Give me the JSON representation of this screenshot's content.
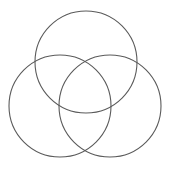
{
  "diagram": {
    "type": "venn",
    "background": "#ffffff",
    "stroke_color": "#5a5a5a",
    "circles": [
      {
        "name": "top",
        "cx": 86,
        "cy": 62,
        "r": 51
      },
      {
        "name": "left",
        "cx": 60,
        "cy": 106,
        "r": 51
      },
      {
        "name": "right",
        "cx": 110,
        "cy": 106,
        "r": 51
      }
    ],
    "labels": []
  }
}
